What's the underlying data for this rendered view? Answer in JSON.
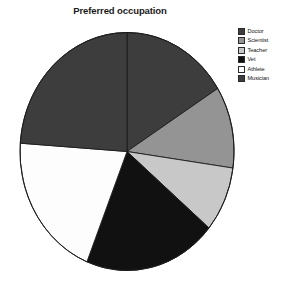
{
  "chart_data": {
    "type": "pie",
    "title": "Preferred occupation",
    "xlabel": "",
    "ylabel": "",
    "categories": [
      "Doctor",
      "Scientist",
      "Teacher",
      "Vet",
      "Athlete",
      "Musician"
    ],
    "values": [
      16.1,
      11.1,
      8.9,
      20.0,
      20.0,
      23.9
    ],
    "angles_deg": [
      58,
      40,
      32,
      72,
      72,
      86
    ],
    "start_angle_deg": 0,
    "direction": "clockwise",
    "colors": [
      "#3d3d3d",
      "#949494",
      "#c8c8c8",
      "#111111",
      "#fdfdfd",
      "#3d3d3d"
    ],
    "edge_color": "#1c1c1c",
    "grid": false,
    "legend_position": "right",
    "legend_entries": [
      {
        "label": "Doctor",
        "color": "#3d3d3d"
      },
      {
        "label": "Scientist",
        "color": "#949494"
      },
      {
        "label": "Teacher",
        "color": "#c8c8c8"
      },
      {
        "label": "Vet",
        "color": "#111111"
      },
      {
        "label": "Athlete",
        "color": "#fdfdfd"
      },
      {
        "label": "Musician",
        "color": "#3d3d3d"
      }
    ]
  },
  "figure": {
    "title": "Preferred occupation",
    "background": "#ffffff"
  },
  "legend": {
    "items": [
      {
        "label": "Doctor"
      },
      {
        "label": "Scientist"
      },
      {
        "label": "Teacher"
      },
      {
        "label": "Vet"
      },
      {
        "label": "Athlete"
      },
      {
        "label": "Musician"
      }
    ]
  }
}
